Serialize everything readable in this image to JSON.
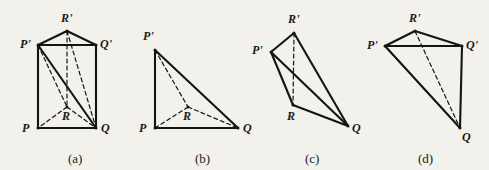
{
  "figure": {
    "background_color": "#f3f1ec",
    "ink_color": "#141412",
    "solid_stroke_width": 2.1,
    "dashed_stroke_width": 1.2,
    "dash_pattern": "4,3",
    "panels": [
      {
        "id": "panel-a",
        "caption": "(a)",
        "caption_pos": {
          "x": 68,
          "y": 152
        },
        "shape_name": "triangular-prism",
        "vertices": [
          {
            "name": "R'",
            "x": 67,
            "y": 31,
            "label_x": 61,
            "label_y": 12
          },
          {
            "name": "P'",
            "x": 38,
            "y": 45,
            "label_x": 20,
            "label_y": 38
          },
          {
            "name": "Q'",
            "x": 96,
            "y": 45,
            "label_x": 100,
            "label_y": 38
          },
          {
            "name": "R",
            "x": 67,
            "y": 107,
            "label_x": 62,
            "label_y": 110
          },
          {
            "name": "P",
            "x": 38,
            "y": 128,
            "label_x": 22,
            "label_y": 122
          },
          {
            "name": "Q",
            "x": 96,
            "y": 128,
            "label_x": 101,
            "label_y": 122
          }
        ],
        "solid_edges": [
          [
            "P'",
            "R'"
          ],
          [
            "R'",
            "Q'"
          ],
          [
            "P'",
            "Q'"
          ],
          [
            "P'",
            "P"
          ],
          [
            "Q'",
            "Q"
          ],
          [
            "P",
            "Q"
          ],
          [
            "P'",
            "Q"
          ]
        ],
        "dashed_edges": [
          [
            "R'",
            "R"
          ],
          [
            "R'",
            "Q"
          ],
          [
            "P'",
            "R"
          ],
          [
            "R",
            "P"
          ],
          [
            "R",
            "Q"
          ]
        ]
      },
      {
        "id": "panel-b",
        "caption": "(b)",
        "caption_pos": {
          "x": 195,
          "y": 152
        },
        "shape_name": "degenerate-flat-tetrahedron",
        "vertices": [
          {
            "name": "P'",
            "x": 155,
            "y": 50,
            "label_x": 143,
            "label_y": 30
          },
          {
            "name": "R",
            "x": 188,
            "y": 107,
            "label_x": 183,
            "label_y": 110
          },
          {
            "name": "P",
            "x": 155,
            "y": 128,
            "label_x": 139,
            "label_y": 122
          },
          {
            "name": "Q",
            "x": 238,
            "y": 128,
            "label_x": 243,
            "label_y": 122
          }
        ],
        "solid_edges": [
          [
            "P'",
            "P"
          ],
          [
            "P",
            "Q"
          ],
          [
            "P'",
            "Q"
          ]
        ],
        "dashed_edges": [
          [
            "P'",
            "R"
          ],
          [
            "R",
            "P"
          ],
          [
            "R",
            "Q"
          ]
        ]
      },
      {
        "id": "panel-c",
        "caption": "(c)",
        "caption_pos": {
          "x": 305,
          "y": 152
        },
        "shape_name": "tetrahedron-PprimeRprimeRQ",
        "vertices": [
          {
            "name": "R'",
            "x": 294,
            "y": 33,
            "label_x": 288,
            "label_y": 13
          },
          {
            "name": "P'",
            "x": 271,
            "y": 52,
            "label_x": 252,
            "label_y": 44
          },
          {
            "name": "R",
            "x": 293,
            "y": 105,
            "label_x": 287,
            "label_y": 110
          },
          {
            "name": "Q",
            "x": 348,
            "y": 126,
            "label_x": 352,
            "label_y": 122
          }
        ],
        "solid_edges": [
          [
            "P'",
            "R'"
          ],
          [
            "R'",
            "Q"
          ],
          [
            "P'",
            "R"
          ],
          [
            "P'",
            "Q"
          ],
          [
            "R",
            "Q"
          ]
        ],
        "dashed_edges": [
          [
            "R'",
            "R"
          ]
        ]
      },
      {
        "id": "panel-d",
        "caption": "(d)",
        "caption_pos": {
          "x": 418,
          "y": 152
        },
        "shape_name": "tetrahedron-PprimeQprimeRprimeQ",
        "vertices": [
          {
            "name": "R'",
            "x": 415,
            "y": 31,
            "label_x": 409,
            "label_y": 12
          },
          {
            "name": "P'",
            "x": 385,
            "y": 46,
            "label_x": 367,
            "label_y": 39
          },
          {
            "name": "Q'",
            "x": 462,
            "y": 46,
            "label_x": 466,
            "label_y": 39
          },
          {
            "name": "Q",
            "x": 460,
            "y": 128,
            "label_x": 462,
            "label_y": 131
          }
        ],
        "solid_edges": [
          [
            "P'",
            "R'"
          ],
          [
            "R'",
            "Q'"
          ],
          [
            "P'",
            "Q'"
          ],
          [
            "Q'",
            "Q"
          ],
          [
            "P'",
            "Q"
          ]
        ],
        "dashed_edges": [
          [
            "R'",
            "Q"
          ]
        ]
      }
    ]
  }
}
